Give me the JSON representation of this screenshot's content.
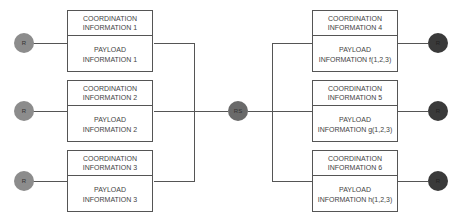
{
  "diagram": {
    "center_node": {
      "label": "RS"
    },
    "sources": [
      {
        "label": "R",
        "coordination": [
          "COORDINATION",
          "INFORMATION 1"
        ],
        "payload": [
          "PAYLOAD",
          "INFORMATION 1"
        ]
      },
      {
        "label": "R",
        "coordination": [
          "COORDINATION",
          "INFORMATION 2"
        ],
        "payload": [
          "PAYLOAD",
          "INFORMATION 2"
        ]
      },
      {
        "label": "R",
        "coordination": [
          "COORDINATION",
          "INFORMATION 3"
        ],
        "payload": [
          "PAYLOAD",
          "INFORMATION 3"
        ]
      }
    ],
    "destinations": [
      {
        "label": "R",
        "coordination": [
          "COORDINATION",
          "INFORMATION 4"
        ],
        "payload": [
          "PAYLOAD",
          "INFORMATION f(1,2,3)"
        ]
      },
      {
        "label": "R",
        "coordination": [
          "COORDINATION",
          "INFORMATION 5"
        ],
        "payload": [
          "PAYLOAD",
          "INFORMATION g(1,2,3)"
        ]
      },
      {
        "label": "R",
        "coordination": [
          "COORDINATION",
          "INFORMATION 6"
        ],
        "payload": [
          "PAYLOAD",
          "INFORMATION h(1,2,3)"
        ]
      }
    ]
  }
}
